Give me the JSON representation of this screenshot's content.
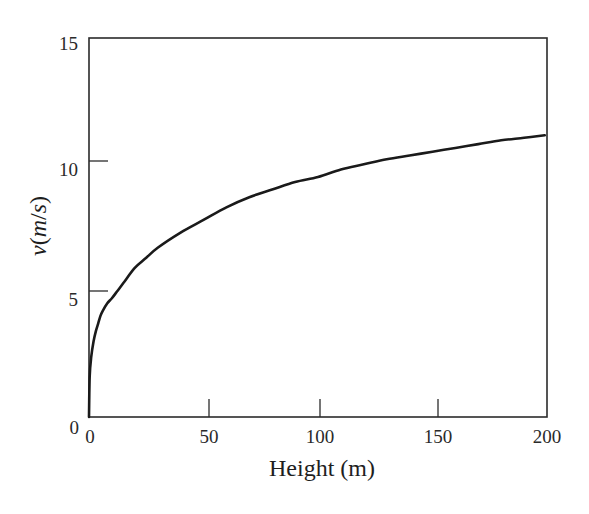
{
  "chart_data": {
    "type": "line",
    "title": "",
    "xlabel": "Height (m)",
    "ylabel": "v(m/s)",
    "ylabel_parts": {
      "v": "v",
      "open": "(",
      "m": "m",
      "slash": "/",
      "s": "s",
      "close": ")"
    },
    "xlim": [
      0,
      200
    ],
    "ylim": [
      0,
      15
    ],
    "xticks": [
      0,
      50,
      100,
      150,
      200
    ],
    "xtick_labels": [
      "0",
      "50",
      "100",
      "150",
      "200"
    ],
    "yticks": [
      0,
      5,
      10,
      15
    ],
    "ytick_labels": [
      "0",
      "5",
      "10",
      "15"
    ],
    "grid": false,
    "legend": null,
    "series": [
      {
        "name": "v vs height",
        "color": "#1a1a1a",
        "x": [
          0,
          0.3,
          1.0,
          2.0,
          3.0,
          4.0,
          5.0,
          6.0,
          8.0,
          10,
          12.5,
          15,
          20,
          25,
          30,
          40,
          50,
          60,
          70,
          80,
          90,
          100,
          110,
          120,
          130,
          140,
          150,
          160,
          170,
          180,
          190,
          199
        ],
        "y": [
          0,
          1.6,
          2.4,
          3.0,
          3.4,
          3.7,
          4.0,
          4.2,
          4.5,
          4.7,
          5.0,
          5.3,
          5.9,
          6.3,
          6.7,
          7.3,
          7.8,
          8.3,
          8.7,
          9.0,
          9.3,
          9.5,
          9.8,
          10.0,
          10.2,
          10.35,
          10.5,
          10.65,
          10.8,
          10.95,
          11.05,
          11.15
        ]
      }
    ]
  },
  "axes": {
    "x_tick_labels": [
      "0",
      "50",
      "100",
      "150",
      "200"
    ],
    "y_tick_labels": [
      "0",
      "5",
      "10",
      "15"
    ],
    "x_label": "Height (m)"
  }
}
